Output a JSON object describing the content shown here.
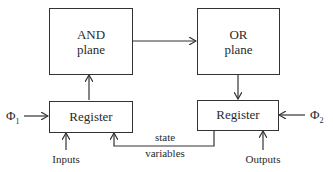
{
  "diagram": {
    "blocks": {
      "and_plane": {
        "line1": "AND",
        "line2": "plane"
      },
      "or_plane": {
        "line1": "OR",
        "line2": "plane"
      },
      "left_register": {
        "label": "Register"
      },
      "right_register": {
        "label": "Register"
      }
    },
    "signals": {
      "phi1": {
        "symbol": "Φ",
        "sub": "1"
      },
      "phi2": {
        "symbol": "Φ",
        "sub": "2"
      },
      "inputs": "Inputs",
      "outputs": "Outputs",
      "state_line1": "state",
      "state_line2": "variables"
    }
  }
}
